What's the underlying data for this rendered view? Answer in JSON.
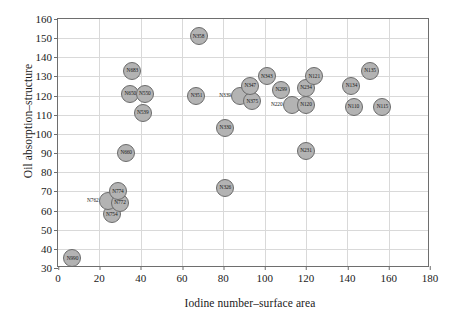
{
  "chart_data": {
    "type": "scatter",
    "title": "",
    "xlabel": "Iodine number–surface area",
    "ylabel": "Oil absorption–structure",
    "xlim": [
      0,
      180
    ],
    "ylim": [
      30,
      160
    ],
    "xticks": [
      0,
      20,
      40,
      60,
      80,
      100,
      120,
      140,
      160,
      180
    ],
    "yticks": [
      30,
      40,
      50,
      60,
      70,
      80,
      90,
      100,
      110,
      120,
      130,
      140,
      150,
      160
    ],
    "grid": true,
    "legend": false,
    "marker": {
      "shape": "circle",
      "fill": "#b3b3b3",
      "edge": "#6b6b6b",
      "labeled": true
    },
    "points": [
      {
        "label": "N990",
        "x": 7,
        "y": 35,
        "label_pos": "inside"
      },
      {
        "label": "N754",
        "x": 26,
        "y": 58,
        "label_pos": "inside"
      },
      {
        "label": "N762",
        "x": 24,
        "y": 65,
        "label_pos": "outside-left"
      },
      {
        "label": "N772",
        "x": 30,
        "y": 64,
        "label_pos": "inside"
      },
      {
        "label": "N774",
        "x": 29,
        "y": 70,
        "label_pos": "inside"
      },
      {
        "label": "N660",
        "x": 33,
        "y": 90,
        "label_pos": "inside"
      },
      {
        "label": "N539",
        "x": 41,
        "y": 111,
        "label_pos": "inside"
      },
      {
        "label": "N650",
        "x": 35,
        "y": 121,
        "label_pos": "inside"
      },
      {
        "label": "N550",
        "x": 42,
        "y": 121,
        "label_pos": "inside"
      },
      {
        "label": "N683",
        "x": 36,
        "y": 133,
        "label_pos": "inside"
      },
      {
        "label": "N326",
        "x": 81,
        "y": 72,
        "label_pos": "inside"
      },
      {
        "label": "N330",
        "x": 81,
        "y": 103,
        "label_pos": "inside"
      },
      {
        "label": "N351",
        "x": 67,
        "y": 120,
        "label_pos": "inside"
      },
      {
        "label": "N358",
        "x": 68,
        "y": 151,
        "label_pos": "inside"
      },
      {
        "label": "N339",
        "x": 88,
        "y": 120,
        "label_pos": "outside-left"
      },
      {
        "label": "N375",
        "x": 94,
        "y": 117,
        "label_pos": "inside"
      },
      {
        "label": "N347",
        "x": 93,
        "y": 125,
        "label_pos": "inside"
      },
      {
        "label": "N343",
        "x": 101,
        "y": 130,
        "label_pos": "inside"
      },
      {
        "label": "N299",
        "x": 108,
        "y": 123,
        "label_pos": "inside"
      },
      {
        "label": "N231",
        "x": 120,
        "y": 91,
        "label_pos": "inside"
      },
      {
        "label": "N220",
        "x": 113,
        "y": 115,
        "label_pos": "outside-left"
      },
      {
        "label": "N120",
        "x": 120,
        "y": 115,
        "label_pos": "inside"
      },
      {
        "label": "N234",
        "x": 120,
        "y": 124,
        "label_pos": "inside"
      },
      {
        "label": "N121",
        "x": 124,
        "y": 130,
        "label_pos": "inside"
      },
      {
        "label": "N110",
        "x": 143,
        "y": 114,
        "label_pos": "inside"
      },
      {
        "label": "N134",
        "x": 142,
        "y": 125,
        "label_pos": "inside"
      },
      {
        "label": "N115",
        "x": 157,
        "y": 114,
        "label_pos": "inside"
      },
      {
        "label": "N135",
        "x": 151,
        "y": 133,
        "label_pos": "inside"
      }
    ]
  }
}
